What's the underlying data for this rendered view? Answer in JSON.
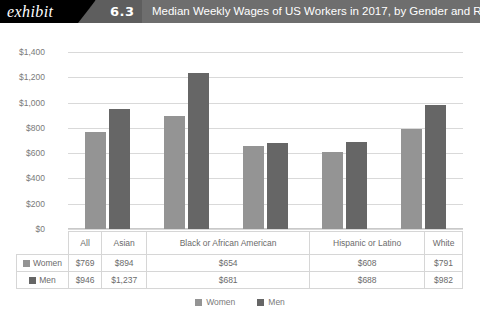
{
  "header": {
    "exhibit_label": "exhibit",
    "exhibit_number": "6.3",
    "title": "Median Weekly Wages of US Workers in 2017, by Gender and Race"
  },
  "legend": {
    "items": [
      {
        "label": "Women",
        "color": "#949494"
      },
      {
        "label": "Men",
        "color": "#666666"
      }
    ]
  },
  "table": {
    "row_labels": [
      "Women",
      "Men"
    ],
    "headers": [
      "All",
      "Asian",
      "Black or African American",
      "Hispanic or Latino",
      "White"
    ],
    "rows": [
      {
        "label": "Women",
        "values": [
          "$769",
          "$894",
          "$654",
          "$608",
          "$791"
        ]
      },
      {
        "label": "Men",
        "values": [
          "$946",
          "$1,237",
          "$681",
          "$688",
          "$982"
        ]
      }
    ]
  },
  "chart_data": {
    "type": "bar",
    "title": "Median Weekly Wages of US Workers in 2017, by Gender and Race",
    "xlabel": "",
    "ylabel": "",
    "categories": [
      "All",
      "Asian",
      "Black or African American",
      "Hispanic or Latino",
      "White"
    ],
    "series": [
      {
        "name": "Women",
        "color": "#949494",
        "values": [
          769,
          894,
          654,
          608,
          791
        ]
      },
      {
        "name": "Men",
        "color": "#666666",
        "values": [
          946,
          1237,
          681,
          688,
          982
        ]
      }
    ],
    "ylim": [
      0,
      1400
    ],
    "ytick_values": [
      0,
      200,
      400,
      600,
      800,
      1000,
      1200,
      1400
    ],
    "ytick_labels": [
      "$0",
      "$200",
      "$400",
      "$600",
      "$800",
      "$1,000",
      "$1,200",
      "$1,400"
    ],
    "grid": true,
    "legend_position": "bottom",
    "value_prefix": "$"
  }
}
